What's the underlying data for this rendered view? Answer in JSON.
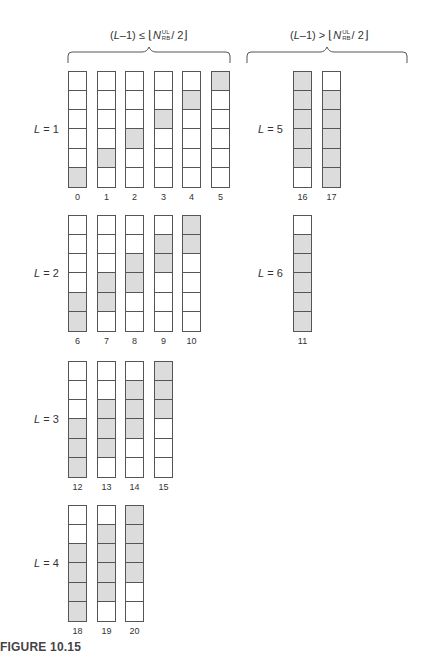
{
  "header": {
    "left": {
      "lhs": "(L–1)",
      "lhs_pre": "(",
      "lhs_var": "L",
      "lhs_post": "–1)",
      "op": "≤",
      "floor_open": "⌊",
      "var": "N",
      "sup": "UL",
      "sub": "RB",
      "rest": "/ 2",
      "floor_close": "⌋"
    },
    "right": {
      "lhs_pre": "(",
      "lhs_var": "L",
      "lhs_post": "–1)",
      "op": ">",
      "floor_open": "⌊",
      "var": "N",
      "sup": "UL",
      "sub": "RB",
      "rest": "/ 2",
      "floor_close": "⌋"
    }
  },
  "colors": {
    "filled": "#dcdcdc",
    "empty": "#ffffff",
    "border": "#555555"
  },
  "groups": [
    {
      "var": "L",
      "eq": " = 1",
      "columns": [
        {
          "label": "0",
          "cells": [
            0,
            0,
            0,
            0,
            0,
            1
          ]
        },
        {
          "label": "1",
          "cells": [
            0,
            0,
            0,
            0,
            1,
            0
          ]
        },
        {
          "label": "2",
          "cells": [
            0,
            0,
            0,
            1,
            0,
            0
          ]
        },
        {
          "label": "3",
          "cells": [
            0,
            0,
            1,
            0,
            0,
            0
          ]
        },
        {
          "label": "4",
          "cells": [
            0,
            1,
            0,
            0,
            0,
            0
          ]
        },
        {
          "label": "5",
          "cells": [
            1,
            0,
            0,
            0,
            0,
            0
          ]
        }
      ]
    },
    {
      "var": "L",
      "eq": " = 2",
      "columns": [
        {
          "label": "6",
          "cells": [
            0,
            0,
            0,
            0,
            1,
            1
          ]
        },
        {
          "label": "7",
          "cells": [
            0,
            0,
            0,
            1,
            1,
            0
          ]
        },
        {
          "label": "8",
          "cells": [
            0,
            0,
            1,
            1,
            0,
            0
          ]
        },
        {
          "label": "9",
          "cells": [
            0,
            1,
            1,
            0,
            0,
            0
          ]
        },
        {
          "label": "10",
          "cells": [
            1,
            1,
            0,
            0,
            0,
            0
          ]
        }
      ]
    },
    {
      "var": "L",
      "eq": " = 3",
      "columns": [
        {
          "label": "12",
          "cells": [
            0,
            0,
            0,
            1,
            1,
            1
          ]
        },
        {
          "label": "13",
          "cells": [
            0,
            0,
            1,
            1,
            1,
            0
          ]
        },
        {
          "label": "14",
          "cells": [
            0,
            1,
            1,
            1,
            0,
            0
          ]
        },
        {
          "label": "15",
          "cells": [
            1,
            1,
            1,
            0,
            0,
            0
          ]
        }
      ]
    },
    {
      "var": "L",
      "eq": " = 4",
      "columns": [
        {
          "label": "18",
          "cells": [
            0,
            0,
            1,
            1,
            1,
            1
          ]
        },
        {
          "label": "19",
          "cells": [
            0,
            1,
            1,
            1,
            1,
            0
          ]
        },
        {
          "label": "20",
          "cells": [
            1,
            1,
            1,
            1,
            0,
            0
          ]
        }
      ]
    },
    {
      "var": "L",
      "eq": " = 5",
      "columns": [
        {
          "label": "16",
          "cells": [
            1,
            1,
            1,
            1,
            1,
            0
          ]
        },
        {
          "label": "17",
          "cells": [
            0,
            1,
            1,
            1,
            1,
            1
          ]
        }
      ]
    },
    {
      "var": "L",
      "eq": " = 6",
      "columns": [
        {
          "label": "11",
          "cells": [
            0,
            1,
            1,
            1,
            1,
            1
          ]
        }
      ]
    }
  ],
  "caption": "FIGURE 10.15"
}
